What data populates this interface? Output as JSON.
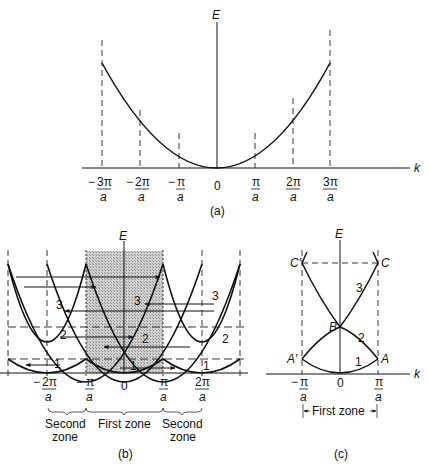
{
  "figure": {
    "panels": [
      {
        "id": "a",
        "caption": "(a)",
        "y_axis_label": "E",
        "x_axis_label": "k",
        "ticks": [
          {
            "num": "3π",
            "den": "a",
            "sign": "-"
          },
          {
            "num": "2π",
            "den": "a",
            "sign": "-"
          },
          {
            "num": "π",
            "den": "a",
            "sign": "-"
          },
          {
            "num": "0",
            "den": "",
            "sign": ""
          },
          {
            "num": "π",
            "den": "a",
            "sign": ""
          },
          {
            "num": "2π",
            "den": "a",
            "sign": ""
          },
          {
            "num": "3π",
            "den": "a",
            "sign": ""
          }
        ]
      },
      {
        "id": "b",
        "caption": "(b)",
        "y_axis_label": "E",
        "ticks": [
          {
            "num": "2π",
            "den": "a",
            "sign": "-"
          },
          {
            "num": "π",
            "den": "a",
            "sign": "-"
          },
          {
            "num": "0",
            "den": "",
            "sign": ""
          },
          {
            "num": "π",
            "den": "a",
            "sign": ""
          },
          {
            "num": "2π",
            "den": "a",
            "sign": ""
          }
        ],
        "band_labels": [
          "1",
          "2",
          "3"
        ],
        "zones": {
          "left": [
            "Second",
            "zone"
          ],
          "center": "First zone",
          "right": [
            "Second",
            "zone"
          ]
        }
      },
      {
        "id": "c",
        "caption": "(c)",
        "y_axis_label": "E",
        "x_axis_label": "k",
        "ticks": [
          {
            "num": "π",
            "den": "a",
            "sign": "-"
          },
          {
            "num": "0",
            "den": "",
            "sign": ""
          },
          {
            "num": "π",
            "den": "a",
            "sign": ""
          }
        ],
        "points": [
          "A",
          "A′",
          "B",
          "C",
          "C′"
        ],
        "band_labels": [
          "1",
          "2",
          "3"
        ],
        "zone_label": "First zone"
      }
    ]
  },
  "colors": {
    "line": "#111111",
    "shade": "#bdbdbd",
    "dash": "#333333"
  }
}
